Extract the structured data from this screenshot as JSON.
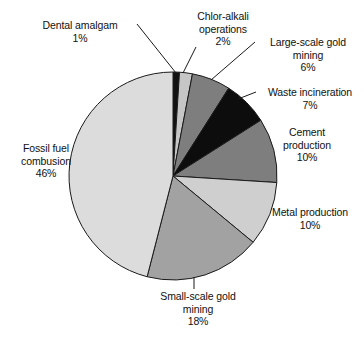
{
  "chart_data": {
    "type": "pie",
    "title": "",
    "xlabel": "",
    "ylabel": "",
    "legend_position": "none",
    "grid": false,
    "units": "percent",
    "start_angle_deg": 0,
    "direction": "clockwise",
    "categories": [
      "Dental amalgam",
      "Chlor-alkali operations",
      "Large-scale gold mining",
      "Waste incineration",
      "Cement production",
      "Metal production",
      "Small-scale gold mining",
      "Fossil fuel combusion"
    ],
    "values": [
      1,
      2,
      6,
      7,
      10,
      10,
      18,
      46
    ],
    "value_labels": [
      "1%",
      "2%",
      "6%",
      "7%",
      "10%",
      "10%",
      "18%",
      "46%"
    ],
    "slice_colors": [
      "#111111",
      "#c6c6c6",
      "#7e7e7e",
      "#0d0d0d",
      "#7e7e7e",
      "#cfcfcf",
      "#a2a2a2",
      "#dcdcdc"
    ],
    "slice_edge_color": "#1a1a1a",
    "total": 100
  },
  "labels": {
    "dental": {
      "line1": "Dental amalgam",
      "line2": "1%"
    },
    "chloralkali": {
      "line1": "Chlor-alkali",
      "line2": "operations",
      "line3": "2%"
    },
    "largegold": {
      "line1": "Large-scale gold",
      "line2": "mining",
      "line3": "6%"
    },
    "waste": {
      "line1": "Waste incineration",
      "line2": "7%"
    },
    "cement": {
      "line1": "Cement",
      "line2": "production",
      "line3": "10%"
    },
    "metal": {
      "line1": "Metal production",
      "line2": "10%"
    },
    "smallgold": {
      "line1": "Small-scale gold",
      "line2": "mining",
      "line3": "18%"
    },
    "fossil": {
      "line1": "Fossil fuel",
      "line2": "combusion",
      "line3": "46%"
    }
  },
  "artifact": {
    "top_cropped_text": ""
  }
}
